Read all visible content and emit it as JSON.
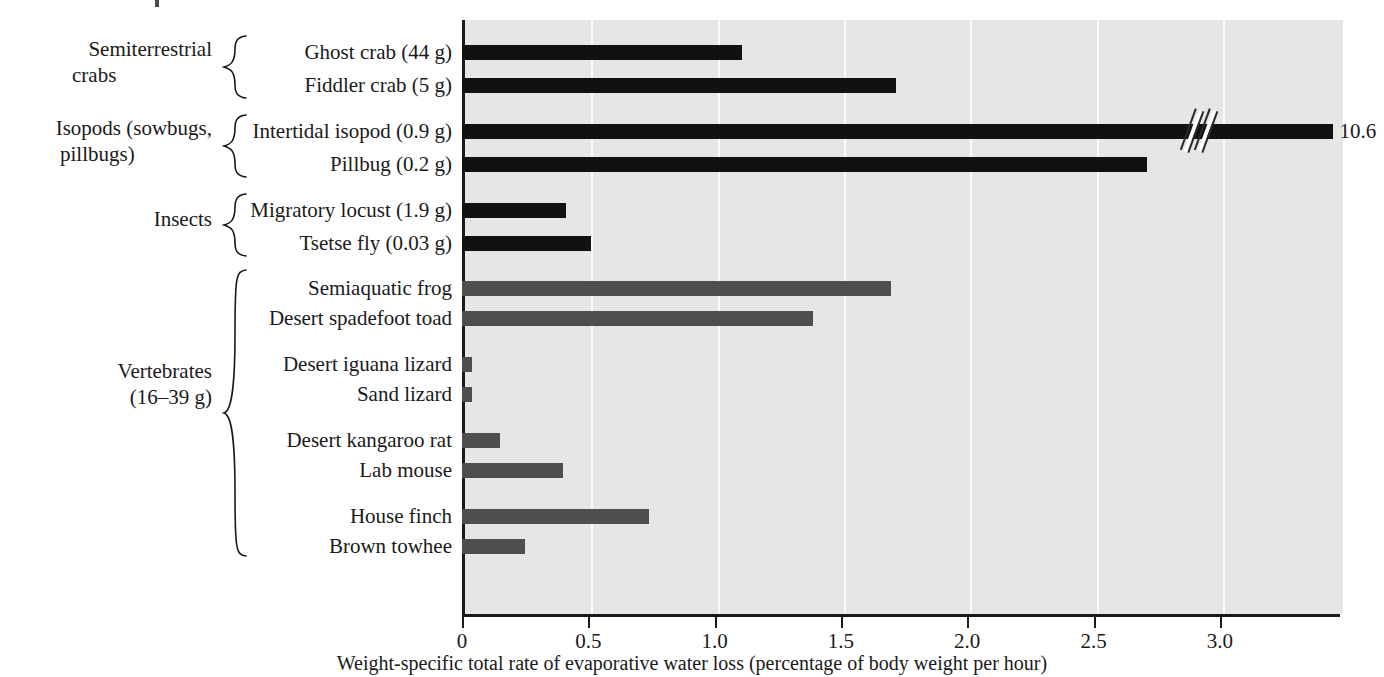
{
  "chart_data": {
    "type": "bar",
    "orientation": "horizontal",
    "title": "",
    "xlabel": "Weight-specific total rate of evaporative water loss (percentage of body weight per hour)",
    "ylabel": "",
    "xlim": [
      0,
      3.48
    ],
    "xticks": [
      0,
      0.5,
      1.0,
      1.5,
      2.0,
      2.5,
      3.0
    ],
    "xticklabels": [
      "0",
      "0.5",
      "1.0",
      "1.5",
      "2.0",
      "2.5",
      "3.0"
    ],
    "grid": "vertical white gridlines at each tick",
    "legend": "none",
    "plot_background": "#e6e6e6",
    "series_colors": {
      "invertebrates": "#111111",
      "vertebrates": "#4e4e4e"
    },
    "axis_break": {
      "present": true,
      "on_category": "Intertidal isopod (0.9 g)",
      "true_value": 10.6,
      "value_label": "10.6"
    },
    "categories": [
      "Ghost crab (44 g)",
      "Fiddler crab (5 g)",
      "Intertidal isopod (0.9 g)",
      "Pillbug (0.2 g)",
      "Migratory locust (1.9 g)",
      "Tsetse fly (0.03 g)",
      "Semiaquatic frog",
      "Desert spadefoot toad",
      "Desert iguana lizard",
      "Sand lizard",
      "Desert kangaroo rat",
      "Lab mouse",
      "House finch",
      "Brown towhee"
    ],
    "values": [
      1.11,
      1.72,
      10.6,
      2.71,
      0.41,
      0.51,
      1.7,
      1.39,
      0.04,
      0.04,
      0.15,
      0.4,
      0.74,
      0.25
    ]
  },
  "bars": [
    {
      "label": "Ghost crab (44 g)",
      "value": 1.11,
      "display_value": "",
      "color": "dark",
      "top": 45,
      "group": "semiterrestrial-crabs"
    },
    {
      "label": "Fiddler crab (5 g)",
      "value": 1.72,
      "display_value": "",
      "color": "dark",
      "top": 78,
      "group": "semiterrestrial-crabs"
    },
    {
      "label": "Intertidal isopod (0.9 g)",
      "value": 3.45,
      "display_value": "10.6",
      "color": "dark",
      "top": 124,
      "group": "isopods"
    },
    {
      "label": "Pillbug (0.2 g)",
      "value": 2.71,
      "display_value": "",
      "color": "dark",
      "top": 157,
      "group": "isopods"
    },
    {
      "label": "Migratory locust (1.9 g)",
      "value": 0.41,
      "display_value": "",
      "color": "dark",
      "top": 203,
      "group": "insects"
    },
    {
      "label": "Tsetse fly (0.03 g)",
      "value": 0.51,
      "display_value": "",
      "color": "dark",
      "top": 236,
      "group": "insects"
    },
    {
      "label": "Semiaquatic frog",
      "value": 1.7,
      "display_value": "",
      "color": "gray",
      "top": 281,
      "group": "vertebrates"
    },
    {
      "label": "Desert spadefoot toad",
      "value": 1.39,
      "display_value": "",
      "color": "gray",
      "top": 311,
      "group": "vertebrates"
    },
    {
      "label": "Desert iguana lizard",
      "value": 0.04,
      "display_value": "",
      "color": "gray",
      "top": 357,
      "group": "vertebrates"
    },
    {
      "label": "Sand lizard",
      "value": 0.04,
      "display_value": "",
      "color": "gray",
      "top": 387,
      "group": "vertebrates"
    },
    {
      "label": "Desert kangaroo rat",
      "value": 0.15,
      "display_value": "",
      "color": "gray",
      "top": 433,
      "group": "vertebrates"
    },
    {
      "label": "Lab mouse",
      "value": 0.4,
      "display_value": "",
      "color": "gray",
      "top": 463,
      "group": "vertebrates"
    },
    {
      "label": "House finch",
      "value": 0.74,
      "display_value": "",
      "color": "gray",
      "top": 509,
      "group": "vertebrates"
    },
    {
      "label": "Brown towhee",
      "value": 0.25,
      "display_value": "",
      "color": "gray",
      "top": 539,
      "group": "vertebrates"
    }
  ],
  "groups": [
    {
      "name": "semiterrestrial-crabs",
      "line1": "Semiterrestrial",
      "line2": "crabs",
      "label_top": 36,
      "brace_top": 34,
      "brace_height": 66
    },
    {
      "name": "isopods",
      "line1": "Isopods (sowbugs,",
      "line2": "pillbugs)",
      "label_top": 115,
      "brace_top": 113,
      "brace_height": 66
    },
    {
      "name": "insects",
      "line1": "Insects",
      "line2": "",
      "label_top": 206,
      "brace_top": 192,
      "brace_height": 66
    },
    {
      "name": "vertebrates",
      "line1": "Vertebrates",
      "line2": "(16–39 g)",
      "label_top": 358,
      "brace_top": 268,
      "brace_height": 290
    }
  ],
  "axis": {
    "ticks": [
      {
        "label": "0",
        "value": 0.0
      },
      {
        "label": "0.5",
        "value": 0.5
      },
      {
        "label": "1.0",
        "value": 1.0
      },
      {
        "label": "1.5",
        "value": 1.5
      },
      {
        "label": "2.0",
        "value": 2.0
      },
      {
        "label": "2.5",
        "value": 2.5
      },
      {
        "label": "3.0",
        "value": 3.0
      }
    ],
    "title": "Weight-specific total rate of evaporative water loss (percentage of body weight per hour)"
  },
  "geometry": {
    "plot_left": 462,
    "plot_top": 20,
    "plot_width": 878,
    "plot_height": 594,
    "px_per_unit": 252.6,
    "label_right_edge": 452,
    "break_center_value": 2.93
  }
}
